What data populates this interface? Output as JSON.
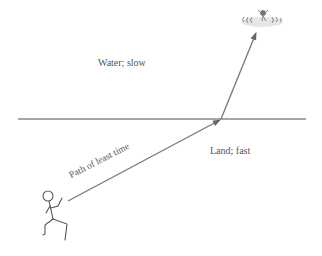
{
  "diagram": {
    "regions": {
      "water_label": "Water; slow",
      "land_label": "Land; fast"
    },
    "path_label": "Path of least time",
    "icons": {
      "swimmer": "drowning-swimmer-icon",
      "runner": "stick-figure-runner-icon"
    },
    "colors": {
      "line": "#777777",
      "text": "#555555"
    }
  }
}
